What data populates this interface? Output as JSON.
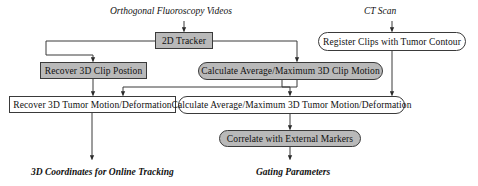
{
  "diagram": {
    "type": "flowchart",
    "colors": {
      "process_fill": "#b9b9b9",
      "plain_fill": "#ffffff",
      "stroke": "#3a3a3a",
      "text": "#101010",
      "background": "#ffffff"
    },
    "inputs": [
      {
        "id": "in-fluoro",
        "label": "Orthogonal Fluoroscopy Videos"
      },
      {
        "id": "in-ct",
        "label": "CT Scan"
      }
    ],
    "outputs": [
      {
        "id": "out-coords",
        "label": "3D Coordinates for Online Tracking"
      },
      {
        "id": "out-gating",
        "label": "Gating Parameters"
      }
    ],
    "nodes": [
      {
        "id": "tracker",
        "label": "2D Tracker",
        "fill": "gray",
        "shape": "rect"
      },
      {
        "id": "register",
        "label": "Register Clips with Tumor Contour",
        "fill": "white",
        "shape": "round"
      },
      {
        "id": "clip-position",
        "label": "Recover 3D Clip Postion",
        "fill": "gray",
        "shape": "rect"
      },
      {
        "id": "clip-motion",
        "label": "Calculate Average/Maximum 3D Clip Motion",
        "fill": "gray",
        "shape": "round"
      },
      {
        "id": "tumor-motion",
        "label": "Recover 3D Tumor Motion/Deformation",
        "fill": "white",
        "shape": "rect"
      },
      {
        "id": "tumor-avg",
        "label": "Calculate Average/Maximum 3D Tumor Motion/Deformation",
        "fill": "white",
        "shape": "round"
      },
      {
        "id": "correlate",
        "label": "Correlate with External Markers",
        "fill": "gray",
        "shape": "round"
      }
    ],
    "edges": [
      {
        "from": "in-fluoro",
        "to": "tracker"
      },
      {
        "from": "in-ct",
        "to": "register"
      },
      {
        "from": "tracker",
        "to": "clip-position"
      },
      {
        "from": "tracker",
        "to": "clip-motion"
      },
      {
        "from": "clip-position",
        "to": "tumor-motion"
      },
      {
        "from": "clip-motion",
        "to": "tumor-motion"
      },
      {
        "from": "clip-motion",
        "to": "tumor-avg"
      },
      {
        "from": "register",
        "to": "tumor-avg"
      },
      {
        "from": "tumor-avg",
        "to": "correlate"
      },
      {
        "from": "tumor-motion",
        "to": "out-coords"
      },
      {
        "from": "correlate",
        "to": "out-gating"
      }
    ]
  }
}
